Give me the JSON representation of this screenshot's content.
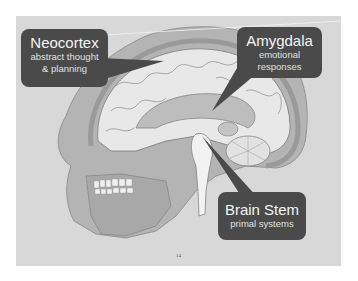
{
  "slide": {
    "page_number": "14",
    "background_color": "#d8d8d8",
    "callout_color": "#4a4a4a",
    "illustration": "sagittal-brain-and-skull"
  },
  "callouts": [
    {
      "id": "neocortex",
      "title": "Neocortex",
      "lines": [
        "abstract thought",
        "& planning"
      ]
    },
    {
      "id": "amygdala",
      "title": "Amygdala",
      "lines": [
        "emotional",
        "responses"
      ]
    },
    {
      "id": "brain_stem",
      "title": "Brain Stem",
      "lines": [
        "primal systems"
      ]
    }
  ]
}
